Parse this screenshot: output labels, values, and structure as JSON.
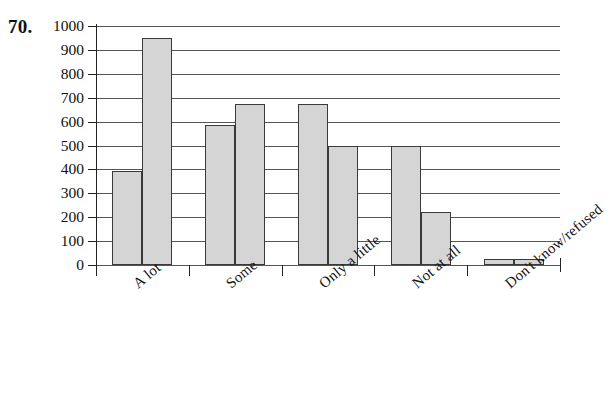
{
  "question": {
    "number": "70."
  },
  "chart_data": {
    "type": "bar",
    "title": "",
    "subtitle": "",
    "xlabel": "",
    "ylabel": "",
    "categories": [
      "A lot",
      "Some",
      "Only a little",
      "Not at all",
      "Don't know/refused"
    ],
    "series": [
      {
        "name": "Series 1",
        "values": [
          395,
          585,
          675,
          500,
          25
        ]
      },
      {
        "name": "Series 2",
        "values": [
          950,
          675,
          500,
          220,
          25
        ]
      }
    ],
    "ylim": [
      0,
      1000
    ],
    "ytick_step": 100,
    "ytick_labels": [
      "1000",
      "900",
      "800",
      "700",
      "600",
      "500",
      "400",
      "300",
      "200",
      "100",
      "0"
    ],
    "ytick_values": [
      1000,
      900,
      800,
      700,
      600,
      500,
      400,
      300,
      200,
      100,
      0
    ],
    "grid": true,
    "grid_axis": "y",
    "legend": false,
    "legend_position": "none",
    "bar_fill_color": "#d5d5d5",
    "bar_edge_color": "#3a3a3a",
    "axis_color": "#222222",
    "gridline_color": "#555555",
    "background_color": "#ffffff",
    "xtick_label_rotation": -40
  }
}
